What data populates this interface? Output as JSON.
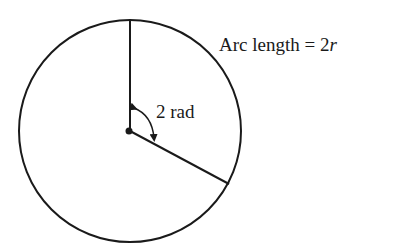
{
  "diagram": {
    "arc_label": {
      "text": "Arc length = 2",
      "var": "r"
    },
    "angle_label": "2 rad",
    "circle": {
      "cx": 130,
      "cy": 131,
      "r": 111
    },
    "colors": {
      "stroke": "#1a1a1a",
      "background": "#ffffff"
    }
  }
}
